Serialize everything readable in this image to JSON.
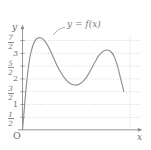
{
  "chart_data": {
    "type": "line",
    "title": "",
    "subtitle": "",
    "xlabel": "x",
    "ylabel": "y",
    "curve_label": "y = f(x)",
    "grid": true,
    "legend_position": "inline-annotation",
    "xlim": [
      0,
      8.6
    ],
    "ylim": [
      0,
      4.0
    ],
    "y_ticks": [
      0.5,
      1,
      1.5,
      2,
      2.5,
      3,
      3.5
    ],
    "y_tick_labels": [
      "1/2",
      "1",
      "3/2",
      "2",
      "5/2",
      "3",
      "7/2"
    ],
    "x_ticks": [],
    "x_tick_labels": [],
    "origin_label": "O",
    "annotations": [
      {
        "text": "y = f(x)",
        "x": 3.2,
        "y": 3.9
      }
    ],
    "x": [
      0.0,
      0.1,
      0.2,
      0.3,
      0.45,
      0.6,
      0.8,
      1.0,
      1.2,
      1.45,
      1.7,
      1.95,
      2.2,
      2.5,
      2.8,
      3.1,
      3.4,
      3.7,
      4.0,
      4.3,
      4.6,
      4.9,
      5.2,
      5.5,
      5.8,
      6.1,
      6.4,
      6.7,
      7.0,
      7.3,
      7.6,
      7.85,
      8.0,
      8.1
    ],
    "y": [
      0.0,
      0.55,
      1.15,
      1.7,
      2.35,
      2.85,
      3.25,
      3.48,
      3.58,
      3.6,
      3.52,
      3.35,
      3.12,
      2.8,
      2.48,
      2.22,
      2.0,
      1.85,
      1.77,
      1.75,
      1.8,
      1.92,
      2.12,
      2.38,
      2.65,
      2.9,
      3.05,
      3.12,
      3.08,
      2.9,
      2.5,
      2.0,
      1.72,
      1.5
    ],
    "features": {
      "local_max_1": {
        "x": 1.45,
        "y": 3.6
      },
      "local_min": {
        "x": 4.3,
        "y": 1.75
      },
      "local_max_2": {
        "x": 6.7,
        "y": 3.12
      },
      "right_endpoint": {
        "x": 8.1,
        "y": 1.5
      },
      "left_endpoint": {
        "x": 0.0,
        "y": 0.0
      }
    }
  },
  "colors": {
    "curve": "#8f8f8f",
    "axis": "#8a8a8a",
    "grid": "#c9c9c9",
    "text": "#6e6e6e",
    "background": "#ffffff"
  },
  "axes": {
    "y_axis_label": "y",
    "x_axis_label": "x",
    "origin": "O"
  },
  "ticks": [
    {
      "label_type": "fraction",
      "num": "7",
      "den": "2",
      "value": 3.5
    },
    {
      "label_type": "integer",
      "text": "3",
      "value": 3
    },
    {
      "label_type": "fraction",
      "num": "5",
      "den": "2",
      "value": 2.5
    },
    {
      "label_type": "integer",
      "text": "2",
      "value": 2
    },
    {
      "label_type": "fraction",
      "num": "3",
      "den": "2",
      "value": 1.5
    },
    {
      "label_type": "integer",
      "text": "1",
      "value": 1
    },
    {
      "label_type": "fraction",
      "num": "1",
      "den": "2",
      "value": 0.5
    }
  ]
}
